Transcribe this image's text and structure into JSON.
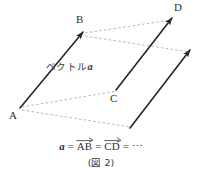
{
  "figure": {
    "caption": "(図 2)",
    "annotation_prefix": "ベクトル",
    "annotation_symbol": "a",
    "vertices": [
      {
        "id": "A",
        "label": "A"
      },
      {
        "id": "B",
        "label": "B"
      },
      {
        "id": "C",
        "label": "C"
      },
      {
        "id": "D",
        "label": "D"
      }
    ],
    "equation": {
      "lhs": "a",
      "eq1": "=",
      "term1": "AB",
      "eq2": "=",
      "term2": "CD",
      "eq3": "=",
      "ellipsis": "⋯"
    },
    "colors": {
      "background": "#ffffff",
      "solid_stroke": "#262626",
      "dashed_stroke": "#9a9a9a",
      "text": "#2f2f2f"
    },
    "geometry": {
      "solid_arrows": [
        {
          "name": "vector-AB",
          "from": [
            20,
            108
          ],
          "to": [
            83,
            32
          ]
        },
        {
          "name": "vector-CD",
          "from": [
            116,
            90
          ],
          "to": [
            172,
            18
          ]
        },
        {
          "name": "vector-third",
          "from": [
            130,
            128
          ],
          "to": [
            190,
            50
          ]
        }
      ],
      "dashed_lines": [
        {
          "name": "dashed-B-to-D",
          "from": [
            85,
            33
          ],
          "to": [
            171,
            20
          ]
        },
        {
          "name": "dashed-B-to-third-tip",
          "from": [
            85,
            36
          ],
          "to": [
            189,
            52
          ]
        },
        {
          "name": "dashed-A-to-C",
          "from": [
            22,
            107
          ],
          "to": [
            117,
            91
          ]
        },
        {
          "name": "dashed-A-to-third-base",
          "from": [
            22,
            110
          ],
          "to": [
            130,
            127
          ]
        }
      ]
    }
  }
}
